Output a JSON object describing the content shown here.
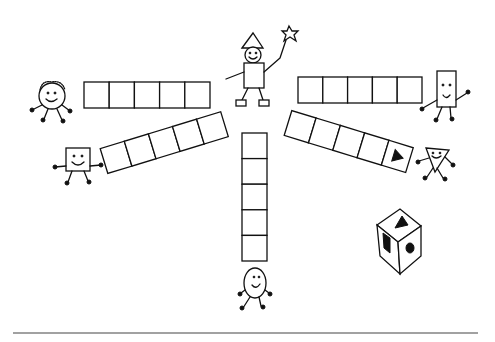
{
  "colors": {
    "ink": "#111111",
    "paper": "#ffffff",
    "rule": "#444444"
  },
  "center_figure": {
    "name": "wizard",
    "holds": "star-wand"
  },
  "paths": [
    {
      "id": "path-circle",
      "owner": "circle",
      "cells": 5,
      "marked_cell": null
    },
    {
      "id": "path-square",
      "owner": "square",
      "cells": 5,
      "marked_cell": null
    },
    {
      "id": "path-oval",
      "owner": "oval",
      "cells": 5,
      "marked_cell": null
    },
    {
      "id": "path-rectangle",
      "owner": "rectangle",
      "cells": 5,
      "marked_cell": null
    },
    {
      "id": "path-triangle",
      "owner": "triangle",
      "cells": 5,
      "marked_cell": 5,
      "marker_icon": "triangle"
    }
  ],
  "characters": [
    "circle",
    "square",
    "oval",
    "rectangle",
    "triangle"
  ],
  "die": {
    "visible_faces": [
      "triangle",
      "square",
      "circle"
    ]
  }
}
